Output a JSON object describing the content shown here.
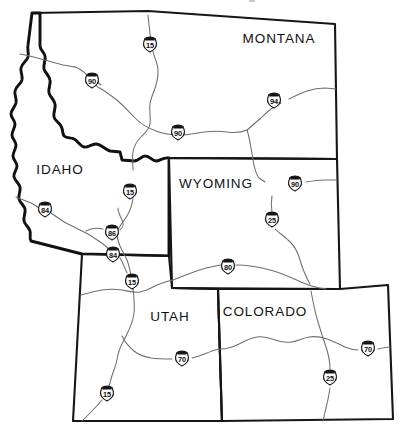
{
  "map": {
    "title": "Interstate highway map of the Rocky Mountain / Intermountain West states",
    "background_color": "#ffffff",
    "border_color": "#161616",
    "highway_color": "#6e6e6e",
    "width": 410,
    "height": 437,
    "states": [
      {
        "id": "montana",
        "name": "MONTANA",
        "label_x": 279,
        "label_y": 39
      },
      {
        "id": "idaho",
        "name": "IDAHO",
        "label_x": 60,
        "label_y": 170
      },
      {
        "id": "wyoming",
        "name": "WYOMING",
        "label_x": 216,
        "label_y": 184
      },
      {
        "id": "utah",
        "name": "UTAH",
        "label_x": 170,
        "label_y": 317
      },
      {
        "id": "colorado",
        "name": "COLORADO",
        "label_x": 265,
        "label_y": 312
      }
    ],
    "shields": [
      {
        "id": "i15-montana",
        "route": "15",
        "x": 150,
        "y": 45,
        "state": "MONTANA"
      },
      {
        "id": "i90-idaho",
        "route": "90",
        "x": 92,
        "y": 81,
        "state": "IDAHO"
      },
      {
        "id": "i94-montana",
        "route": "94",
        "x": 274,
        "y": 101,
        "state": "MONTANA"
      },
      {
        "id": "i90-montana",
        "route": "90",
        "x": 178,
        "y": 133,
        "state": "MONTANA"
      },
      {
        "id": "i90-wyoming",
        "route": "90",
        "x": 295,
        "y": 184,
        "state": "WYOMING"
      },
      {
        "id": "i15-idaho-n",
        "route": "15",
        "x": 130,
        "y": 192,
        "state": "IDAHO"
      },
      {
        "id": "i84-idaho-w",
        "route": "84",
        "x": 45,
        "y": 210,
        "state": "IDAHO"
      },
      {
        "id": "i25-wyoming",
        "route": "25",
        "x": 272,
        "y": 220,
        "state": "WYOMING"
      },
      {
        "id": "i86-idaho",
        "route": "86",
        "x": 112,
        "y": 233,
        "state": "IDAHO"
      },
      {
        "id": "i84-idaho-s",
        "route": "84",
        "x": 113,
        "y": 255,
        "state": "IDAHO"
      },
      {
        "id": "i80-wyoming",
        "route": "80",
        "x": 228,
        "y": 267,
        "state": "WYOMING"
      },
      {
        "id": "i15-utah-n",
        "route": "15",
        "x": 132,
        "y": 282,
        "state": "UTAH"
      },
      {
        "id": "i70-utah",
        "route": "70",
        "x": 182,
        "y": 359,
        "state": "UTAH"
      },
      {
        "id": "i70-colorado",
        "route": "70",
        "x": 368,
        "y": 349,
        "state": "COLORADO"
      },
      {
        "id": "i25-colorado",
        "route": "25",
        "x": 330,
        "y": 378,
        "state": "COLORADO"
      },
      {
        "id": "i15-utah-s",
        "route": "15",
        "x": 107,
        "y": 394,
        "state": "UTAH"
      }
    ]
  }
}
